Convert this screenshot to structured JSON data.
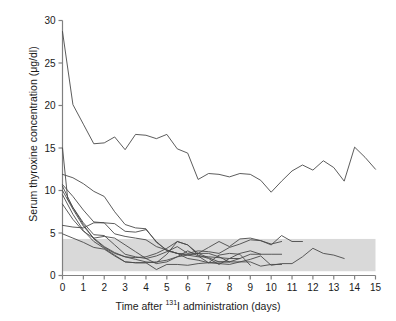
{
  "figure": {
    "background": "#ffffff",
    "line_color": "#4a4a4a",
    "axis_color": "#808080",
    "band_color": "#d9d9d9",
    "text_color": "#1a1a1a"
  },
  "axis_labels": {
    "y": "Serum thyroxine concentration (μg/dl)",
    "x_pre": "Time after ",
    "x_sup": "131",
    "x_post": "I administration (days)"
  },
  "chart_data": {
    "type": "line",
    "title": "",
    "xlabel": "Time after 131I administration (days)",
    "ylabel": "Serum thyroxine concentration (μg/dl)",
    "xlim": [
      0,
      15
    ],
    "ylim": [
      0,
      30
    ],
    "xticks": [
      0,
      1,
      2,
      3,
      4,
      5,
      6,
      7,
      8,
      9,
      10,
      11,
      12,
      13,
      14,
      15
    ],
    "yticks": [
      0,
      5,
      10,
      15,
      20,
      25,
      30
    ],
    "xtick_labels": [
      "0",
      "1",
      "2",
      "3",
      "4",
      "5",
      "6",
      "7",
      "8",
      "9",
      "10",
      "11",
      "12",
      "13",
      "14",
      "15"
    ],
    "ytick_labels": [
      "0",
      "5",
      "10",
      "15",
      "20",
      "25",
      "30"
    ],
    "grid": false,
    "legend": false,
    "annotations": [
      {
        "type": "hband",
        "name": "reference-range-band",
        "label": "normal reference range",
        "y0": 0.5,
        "y1": 4.3,
        "x0": 0,
        "x1": 15,
        "color": "#d9d9d9"
      }
    ],
    "series": [
      {
        "name": "cat-1",
        "x": [
          0,
          0.5,
          1,
          1.5,
          2,
          2.5,
          3,
          3.5,
          4,
          4.5,
          5,
          5.5,
          6,
          6.5,
          7,
          7.5,
          8,
          8.5,
          9,
          9.5,
          10,
          10.5,
          11,
          11.5,
          12,
          12.5,
          13,
          13.5,
          14,
          14.5,
          15
        ],
        "values": [
          28.7,
          20.1,
          17.8,
          15.5,
          15.6,
          16.3,
          14.8,
          16.6,
          16.5,
          16.1,
          16.6,
          14.9,
          14.4,
          11.3,
          12.0,
          11.9,
          11.6,
          12.0,
          11.9,
          11.2,
          9.8,
          11.1,
          12.3,
          13.0,
          12.4,
          13.5,
          12.7,
          11.1,
          15.1,
          13.9,
          12.5
        ]
      },
      {
        "name": "cat-2",
        "x": [
          0,
          0.25,
          0.5,
          1,
          1.5,
          2,
          2.5,
          3,
          3.5,
          4,
          4.5,
          5,
          5.5,
          6,
          6.5,
          7,
          7.5,
          8,
          8.5,
          9,
          9.5,
          10,
          10.5,
          11,
          11.5
        ],
        "values": [
          15.0,
          9.0,
          8.0,
          6.0,
          4.3,
          3.3,
          2.6,
          2.2,
          1.9,
          1.6,
          1.5,
          2.5,
          4.0,
          3.6,
          2.6,
          3.3,
          4.0,
          3.4,
          4.3,
          4.4,
          4.1,
          3.6,
          4.7,
          4.0,
          4.0
        ]
      },
      {
        "name": "cat-3",
        "x": [
          0,
          0.5,
          1,
          1.5,
          2,
          2.5,
          3,
          3.5,
          4,
          4.5,
          5,
          5.5,
          6,
          6.5,
          7,
          7.5,
          8,
          8.5,
          9,
          9.5,
          10,
          10.5,
          11,
          11.5,
          12,
          12.5,
          13,
          13.5
        ],
        "values": [
          11.9,
          11.5,
          10.8,
          9.9,
          9.3,
          7.5,
          6.0,
          5.6,
          5.5,
          3.9,
          3.0,
          2.6,
          2.0,
          1.8,
          1.5,
          1.4,
          1.3,
          1.6,
          1.9,
          2.3,
          1.2,
          1.4,
          1.4,
          2.2,
          3.2,
          2.6,
          2.4,
          2.0
        ]
      },
      {
        "name": "cat-4",
        "x": [
          0,
          0.5,
          1,
          1.5,
          2,
          2.5,
          3,
          3.5,
          4,
          4.5,
          5,
          5.5,
          6,
          6.5,
          7,
          7.5,
          8,
          8.5,
          9,
          9.5,
          10,
          10.5
        ],
        "values": [
          10.7,
          9.3,
          7.7,
          6.3,
          6.2,
          6.1,
          5.2,
          5.1,
          5.4,
          4.0,
          2.9,
          2.6,
          2.5,
          2.6,
          2.1,
          1.6,
          1.6,
          2.0,
          2.5,
          2.5,
          2.5,
          2.5
        ]
      },
      {
        "name": "cat-5",
        "x": [
          0,
          0.5,
          1,
          1.5,
          2,
          2.5,
          3,
          3.5,
          4,
          4.5,
          5,
          5.5,
          6,
          6.5,
          7,
          7.5,
          8,
          8.5,
          9,
          9.5,
          10,
          10.5
        ],
        "values": [
          10.5,
          8.0,
          6.2,
          4.8,
          4.7,
          3.6,
          2.5,
          2.2,
          2.0,
          2.3,
          2.8,
          3.4,
          2.6,
          2.9,
          2.8,
          2.6,
          3.3,
          3.7,
          4.2,
          4.1,
          3.7,
          4.0
        ]
      },
      {
        "name": "cat-6",
        "x": [
          0,
          0.5,
          1,
          1.5,
          2,
          2.5,
          3,
          3.5,
          4,
          4.5,
          5,
          5.5,
          6,
          6.5,
          7,
          7.5,
          8,
          8.5,
          9,
          9.5
        ],
        "values": [
          10.0,
          7.8,
          5.8,
          4.4,
          3.4,
          2.7,
          2.2,
          2.1,
          2.2,
          2.6,
          3.2,
          4.0,
          3.6,
          2.4,
          2.0,
          1.3,
          2.0,
          2.6,
          2.9,
          2.5
        ]
      },
      {
        "name": "cat-7",
        "x": [
          0,
          0.5,
          1,
          1.5,
          2,
          2.5,
          3,
          3.5,
          4,
          4.5,
          5,
          5.5,
          6,
          6.5,
          7,
          7.5,
          8,
          8.5,
          9,
          9.5,
          10,
          10.5
        ],
        "values": [
          9.5,
          7.2,
          5.3,
          4.0,
          3.2,
          2.4,
          1.6,
          1.5,
          1.5,
          1.6,
          1.8,
          2.2,
          2.4,
          2.6,
          2.6,
          2.2,
          1.6,
          1.6,
          1.6,
          1.1,
          1.3,
          1.3
        ]
      },
      {
        "name": "cat-8",
        "x": [
          0,
          0.5,
          1,
          1.5,
          2,
          2.5,
          3,
          3.5,
          4,
          4.5,
          5,
          5.5,
          6,
          6.5,
          7,
          7.5,
          8
        ],
        "values": [
          8.4,
          6.6,
          5.2,
          4.4,
          4.6,
          4.4,
          3.6,
          2.8,
          2.0,
          1.4,
          1.6,
          2.2,
          2.9,
          2.3,
          1.5,
          1.6,
          1.6
        ]
      },
      {
        "name": "cat-9",
        "x": [
          0,
          0.5,
          1,
          1.5,
          2,
          2.5,
          3,
          3.5,
          4,
          4.5,
          5,
          5.5,
          6,
          6.5,
          7,
          7.5,
          8,
          8.5
        ],
        "values": [
          5.9,
          5.7,
          5.6,
          6.2,
          6.2,
          4.9,
          4.6,
          4.4,
          4.2,
          3.4,
          3.0,
          2.6,
          2.4,
          2.2,
          2.2,
          2.1,
          2.0,
          2.0
        ]
      },
      {
        "name": "cat-10",
        "x": [
          0,
          0.5,
          1,
          1.5,
          2,
          2.5,
          3,
          3.5,
          4,
          4.5,
          5,
          5.5,
          6,
          6.5,
          7,
          7.5,
          8,
          8.5,
          9
        ],
        "values": [
          4.9,
          4.4,
          3.9,
          3.3,
          3.1,
          2.3,
          1.6,
          1.5,
          1.5,
          0.7,
          1.3,
          1.3,
          1.2,
          1.4,
          1.5,
          2.4,
          2.6,
          2.5,
          1.2
        ]
      }
    ]
  }
}
